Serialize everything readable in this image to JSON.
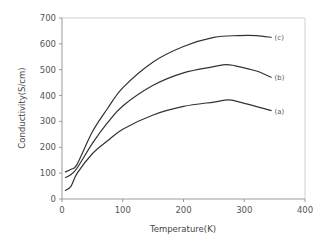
{
  "chart_data": {
    "type": "line",
    "title": "",
    "xlabel": "Temperature(K)",
    "ylabel": "Conductivity(S/cm)",
    "xlim": [
      0,
      400
    ],
    "ylim": [
      0,
      700
    ],
    "xticks": [
      0,
      100,
      200,
      300,
      400
    ],
    "yticks": [
      0,
      100,
      200,
      300,
      400,
      500,
      600,
      700
    ],
    "grid": false,
    "legend": "inline labels at curve ends",
    "series": [
      {
        "name": "(c)",
        "x": [
          5,
          15,
          25,
          50,
          75,
          100,
          150,
          200,
          250,
          290,
          320,
          345
        ],
        "y": [
          104,
          115,
          135,
          260,
          350,
          430,
          530,
          590,
          625,
          632,
          632,
          625
        ]
      },
      {
        "name": "(b)",
        "x": [
          5,
          15,
          25,
          50,
          75,
          100,
          150,
          200,
          250,
          270,
          285,
          320,
          345
        ],
        "y": [
          82,
          95,
          120,
          215,
          295,
          360,
          440,
          488,
          512,
          520,
          515,
          495,
          470
        ]
      },
      {
        "name": "(a)",
        "x": [
          5,
          15,
          25,
          50,
          75,
          100,
          150,
          200,
          250,
          275,
          300,
          345
        ],
        "y": [
          32,
          50,
          100,
          175,
          225,
          270,
          325,
          358,
          375,
          383,
          370,
          342
        ]
      }
    ]
  },
  "axes": {
    "x_title": "Temperature(K)",
    "y_title": "Conductivity(S/cm)"
  }
}
